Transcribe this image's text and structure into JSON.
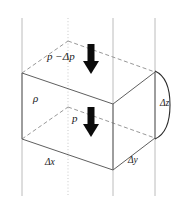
{
  "figure": {
    "labels": {
      "pressure_top": "p −Δp",
      "pressure_bottom": "p",
      "density": "ρ",
      "dim_x": "Δx",
      "dim_y": "Δy",
      "dim_z": "Δz"
    },
    "icons": {
      "arrow_top": "down-arrow-icon",
      "arrow_bottom": "down-arrow-icon",
      "brace_z": "curly-brace-icon"
    },
    "colors": {
      "edge_solid": "#5f5f5f",
      "edge_dashed": "#8c8c8c",
      "guide_line": "#b4b4b4",
      "guide_dotted": "#c3c3c3",
      "arrow_fill": "#0b0b0b",
      "text": "#1a1a1a",
      "background": "#ffffff"
    },
    "geometry": {
      "top_face": [
        [
          22,
          73
        ],
        [
          68,
          41
        ],
        [
          155,
          72
        ],
        [
          113,
          104
        ]
      ],
      "bottom_face": [
        [
          22,
          139
        ],
        [
          68,
          107
        ],
        [
          155,
          138
        ],
        [
          113,
          170
        ]
      ],
      "vertical_guides_x": [
        22,
        68,
        113,
        155
      ],
      "dotted_guide_x": 68
    }
  }
}
